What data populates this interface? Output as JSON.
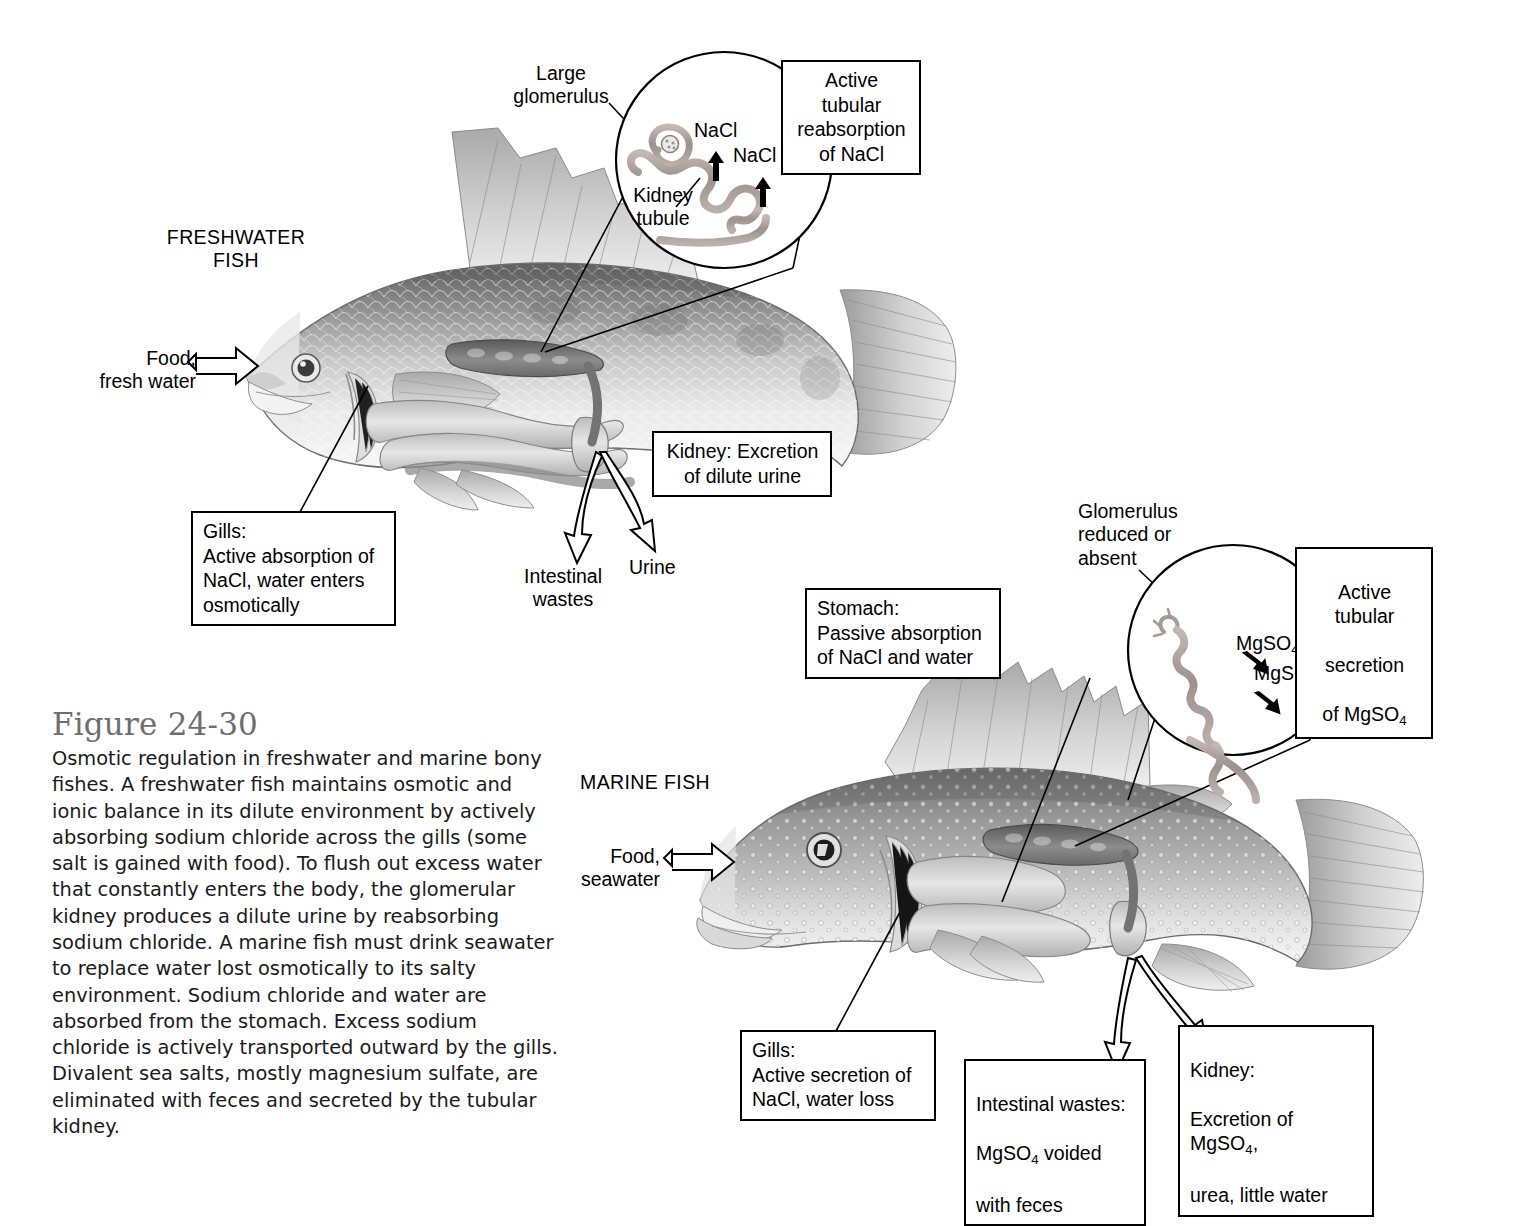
{
  "figure": {
    "number": "Figure 24-30",
    "caption": "Osmotic regulation in freshwater and marine bony fishes. A freshwater fish maintains osmotic and ionic balance in its dilute environment by actively absorbing sodium chloride across the gills (some salt is gained with food). To flush out excess water that constantly enters the body, the glomerular kidney produces a dilute urine by reabsorbing sodium chloride. A marine fish must drink seawater to replace water lost osmotically to its salty environment. Sodium chloride and water are absorbed from the stomach. Excess sodium chloride is actively transported outward by the gills. Divalent sea salts, mostly magnesium sulfate, are eliminated with feces and secreted by the tubular kidney."
  },
  "freshwater": {
    "heading": "FRESHWATER\nFISH",
    "input_label": "Food,\nfresh water",
    "glomerulus_label": "Large\nglomerulus",
    "tubule_label": "Kidney\ntubule",
    "ion_label_1": "NaCl",
    "ion_label_2": "NaCl",
    "tubule_box": "Active tubular\nreabsorption\nof NaCl",
    "kidney_box": "Kidney: Excretion\nof dilute urine",
    "gills_box": "Gills:\nActive absorption of\nNaCl, water enters\nosmotically",
    "intestinal_label": "Intestinal\nwastes",
    "urine_label": "Urine"
  },
  "marine": {
    "heading": "MARINE FISH",
    "input_label": "Food,\nseawater",
    "glomerulus_label": "Glomerulus\nreduced or\nabsent",
    "ion_label_1_pre": "MgSO",
    "ion_label_1_sub": "4",
    "ion_label_2_pre": "MgSO",
    "ion_label_2_sub": "4",
    "tubule_box_l1": "Active tubular",
    "tubule_box_l2": "secretion",
    "tubule_box_l3_pre": "of MgSO",
    "tubule_box_l3_sub": "4",
    "stomach_box": "Stomach:\nPassive absorption\nof NaCl and water",
    "gills_box": "Gills:\nActive secretion of\nNaCl, water loss",
    "intestinal_box_l1": "Intestinal wastes:",
    "intestinal_box_l2_pre": "MgSO",
    "intestinal_box_l2_sub": "4",
    "intestinal_box_l2_post": " voided",
    "intestinal_box_l3": "with feces",
    "kidney_box_l1": "Kidney:",
    "kidney_box_l2_pre": "Excretion of MgSO",
    "kidney_box_l2_sub": "4",
    "kidney_box_l2_post": ",",
    "kidney_box_l3": "urea, little water"
  },
  "colors": {
    "ink": "#000000",
    "caption_title": "#6e6e6e",
    "body_text": "#1a1a1a",
    "fish_mid": "#9a9a9a",
    "fish_dark": "#5e5e5e",
    "fish_light": "#d9d9d9",
    "tubule": "#a89a96",
    "background": "#ffffff"
  }
}
